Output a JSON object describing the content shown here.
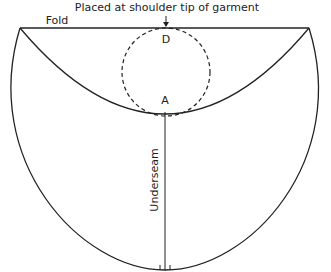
{
  "diagram": {
    "type": "sleeve pattern (circular cap)",
    "labels": {
      "top_note": "Placed at shoulder tip of garment",
      "fold": "Fold",
      "point_d": "D",
      "point_a": "A",
      "underseam": "Underseam"
    },
    "colors": {
      "line": "#222222",
      "background": "#ffffff"
    }
  }
}
